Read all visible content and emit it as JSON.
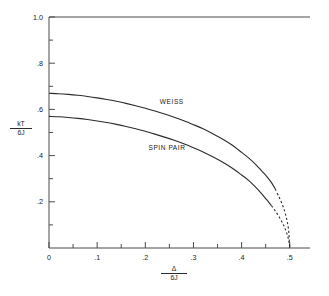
{
  "figure": {
    "name": "phase-boundary-plot",
    "background": "#ffffff",
    "ink_color": "#2b2b2b"
  },
  "axes": {
    "y_title_numerator": "kT",
    "y_title_denominator": "6J",
    "x_title_numerator": "Δ",
    "x_title_denominator": "6J",
    "x_tick_labels": [
      "0",
      ".1",
      ".2",
      ".3",
      ".4",
      ".5"
    ],
    "x_tick_values": [
      0,
      0.1,
      0.2,
      0.3,
      0.4,
      0.5
    ],
    "y_tick_labels": [
      "1.0",
      ".8",
      ".6",
      ".4",
      ".2"
    ],
    "y_tick_values": [
      1.0,
      0.8,
      0.6,
      0.4,
      0.2
    ],
    "x_minor_values": [
      0.05,
      0.15,
      0.25,
      0.35,
      0.45
    ],
    "y_minor_values": [
      0.9,
      0.7,
      0.5,
      0.3,
      0.1
    ],
    "xlim": [
      0,
      0.542
    ],
    "ylim": [
      0,
      1.0
    ]
  },
  "chart_data": {
    "type": "line",
    "title": "",
    "xlabel": "Δ/6J",
    "ylabel": "kT/6J",
    "xlim": [
      0,
      0.542
    ],
    "ylim": [
      0,
      1.0
    ],
    "grid": false,
    "legend": "inline-annotations",
    "annotations": [
      {
        "text": "WEISS",
        "x": 0.255,
        "y": 0.625
      },
      {
        "text": "SPIN PAIR",
        "x": 0.245,
        "y": 0.425
      }
    ],
    "series": [
      {
        "name": "WEISS",
        "linestyle_solid_upto_x": 0.462,
        "linestyle_after": "dashed",
        "x": [
          0.0,
          0.02,
          0.04,
          0.06,
          0.08,
          0.1,
          0.12,
          0.14,
          0.16,
          0.18,
          0.2,
          0.22,
          0.24,
          0.26,
          0.28,
          0.3,
          0.32,
          0.34,
          0.36,
          0.38,
          0.4,
          0.415,
          0.43,
          0.442,
          0.452,
          0.462,
          0.47,
          0.477,
          0.483,
          0.489,
          0.493,
          0.496,
          0.498,
          0.499,
          0.5
        ],
        "y": [
          0.67,
          0.668,
          0.665,
          0.661,
          0.656,
          0.65,
          0.643,
          0.635,
          0.626,
          0.616,
          0.605,
          0.593,
          0.58,
          0.566,
          0.551,
          0.534,
          0.516,
          0.495,
          0.472,
          0.446,
          0.414,
          0.389,
          0.36,
          0.333,
          0.31,
          0.283,
          0.255,
          0.224,
          0.196,
          0.162,
          0.131,
          0.1,
          0.068,
          0.036,
          0.0
        ]
      },
      {
        "name": "SPIN PAIR",
        "linestyle_solid_upto_x": 0.452,
        "linestyle_after": "dashed",
        "x": [
          0.0,
          0.02,
          0.04,
          0.06,
          0.08,
          0.1,
          0.12,
          0.14,
          0.16,
          0.18,
          0.2,
          0.22,
          0.24,
          0.26,
          0.28,
          0.3,
          0.32,
          0.34,
          0.36,
          0.38,
          0.4,
          0.415,
          0.428,
          0.44,
          0.452,
          0.462,
          0.47,
          0.478,
          0.485,
          0.49,
          0.494,
          0.497,
          0.499,
          0.5
        ],
        "y": [
          0.57,
          0.568,
          0.565,
          0.561,
          0.556,
          0.55,
          0.543,
          0.535,
          0.526,
          0.516,
          0.505,
          0.493,
          0.48,
          0.466,
          0.451,
          0.434,
          0.416,
          0.395,
          0.372,
          0.346,
          0.316,
          0.292,
          0.266,
          0.239,
          0.209,
          0.183,
          0.16,
          0.134,
          0.108,
          0.085,
          0.062,
          0.04,
          0.018,
          0.0
        ]
      }
    ]
  }
}
